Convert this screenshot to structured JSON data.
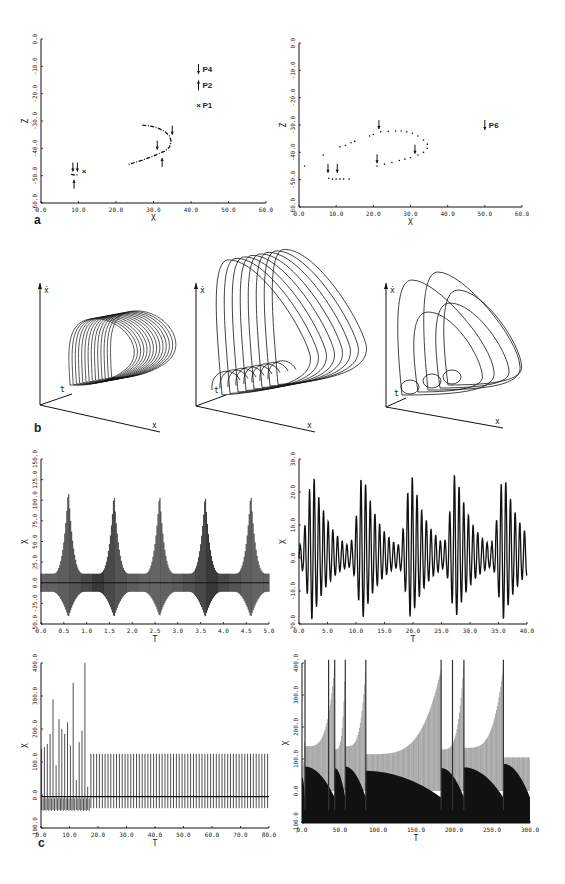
{
  "figure": {
    "panel_labels": {
      "a": "a",
      "b": "b",
      "c": "c"
    }
  },
  "chart_data": [
    {
      "id": "a-left",
      "type": "scatter",
      "title": "",
      "xlabel": "X",
      "ylabel": "Z",
      "xlim": [
        0,
        60
      ],
      "ylim": [
        -60,
        0
      ],
      "xticks": [
        "0.0",
        "10.0",
        "20.0",
        "30.0",
        "40.0",
        "50.0",
        "60.0"
      ],
      "yticks": [
        "0.0",
        "-10.0",
        "-20.0",
        "-30.0",
        "-40.0",
        "-50.0",
        "-60.0"
      ],
      "annotations": [
        {
          "text": "P4",
          "marker": "arrow-down",
          "x": 42,
          "y": -11
        },
        {
          "text": "P2",
          "marker": "arrow-up",
          "x": 42,
          "y": -17
        },
        {
          "text": "P1",
          "marker": "x",
          "x": 42,
          "y": -24
        }
      ],
      "series": [
        {
          "name": "P1",
          "marker": "x",
          "points": [
            [
              11.5,
              -48.5
            ]
          ]
        },
        {
          "name": "curve",
          "marker": "dash",
          "points": [
            [
              27,
              -31.5
            ],
            [
              29,
              -31.8
            ],
            [
              31,
              -32.5
            ],
            [
              33,
              -33.8
            ],
            [
              34.3,
              -35.5
            ],
            [
              34.7,
              -37.5
            ],
            [
              34.3,
              -39.5
            ],
            [
              33,
              -41
            ],
            [
              31,
              -42.2
            ],
            [
              29,
              -43.3
            ],
            [
              27,
              -44.3
            ],
            [
              25,
              -45.2
            ],
            [
              23,
              -46
            ]
          ]
        },
        {
          "name": "cluster",
          "marker": "dash",
          "points": [
            [
              8,
              -49.5
            ],
            [
              9,
              -49.8
            ],
            [
              10,
              -49.6
            ]
          ]
        }
      ],
      "arrows": [
        {
          "dir": "down",
          "x": 35,
          "y": -35
        },
        {
          "dir": "down",
          "x": 31,
          "y": -40.5
        },
        {
          "dir": "up",
          "x": 32.3,
          "y": -43.5
        },
        {
          "dir": "down",
          "x": 8.5,
          "y": -48.5
        },
        {
          "dir": "down",
          "x": 9.7,
          "y": -48.5
        },
        {
          "dir": "up",
          "x": 8.8,
          "y": -51.5
        }
      ]
    },
    {
      "id": "a-right",
      "type": "scatter",
      "xlabel": "X",
      "ylabel": "Z",
      "xlim": [
        0,
        60
      ],
      "ylim": [
        -60,
        0
      ],
      "xticks": [
        "0.0",
        "10.0",
        "20.0",
        "30.0",
        "40.0",
        "50.0",
        "60.0"
      ],
      "yticks": [
        "0.0",
        "-10.0",
        "-20.0",
        "-30.0",
        "-40.0",
        "-50.0",
        "-60.0"
      ],
      "annotations": [
        {
          "text": "P6",
          "marker": "arrow-down",
          "x": 50,
          "y": -30
        }
      ],
      "series": [
        {
          "name": "orbit",
          "marker": "dot",
          "points": [
            [
              1.5,
              -45
            ],
            [
              6.5,
              -41
            ],
            [
              11,
              -38
            ],
            [
              12.5,
              -37.5
            ],
            [
              14,
              -36.5
            ],
            [
              15,
              -36
            ],
            [
              19,
              -34
            ],
            [
              20,
              -33.5
            ],
            [
              22,
              -32.5
            ],
            [
              24,
              -32.3
            ],
            [
              26,
              -32.2
            ],
            [
              27.5,
              -32.2
            ],
            [
              29,
              -32.5
            ],
            [
              30.5,
              -33
            ],
            [
              32,
              -34
            ],
            [
              33.5,
              -35.5
            ],
            [
              34.5,
              -37
            ],
            [
              34.5,
              -38.5
            ],
            [
              33.5,
              -40
            ],
            [
              32,
              -41
            ],
            [
              30,
              -42
            ],
            [
              28.5,
              -42.5
            ],
            [
              27,
              -43
            ],
            [
              25,
              -43.7
            ],
            [
              23,
              -44.3
            ],
            [
              21,
              -45
            ],
            [
              8,
              -49.5
            ],
            [
              9,
              -49.8
            ],
            [
              10,
              -49.8
            ],
            [
              11,
              -49.8
            ],
            [
              12,
              -49.8
            ],
            [
              13.5,
              -49.8
            ]
          ]
        }
      ],
      "arrows": [
        {
          "dir": "down",
          "x": 21.5,
          "y": -31.5
        },
        {
          "dir": "down",
          "x": 31.2,
          "y": -40.5
        },
        {
          "dir": "down",
          "x": 21,
          "y": -44
        },
        {
          "dir": "down",
          "x": 7.8,
          "y": -47.5
        },
        {
          "dir": "down",
          "x": 10.3,
          "y": -47.5
        }
      ]
    },
    {
      "id": "b-left",
      "type": "line",
      "title": "3D phase portrait",
      "axis_labels": {
        "vertical": "ẋ",
        "depth": "t",
        "horizontal": "x"
      },
      "loops": 14
    },
    {
      "id": "b-middle",
      "type": "line",
      "axis_labels": {
        "vertical": "ẋ",
        "depth": "t",
        "horizontal": "x"
      },
      "loops": 8
    },
    {
      "id": "b-right",
      "type": "line",
      "axis_labels": {
        "vertical": "ẋ",
        "depth": "t",
        "horizontal": "x"
      },
      "loops": 5
    },
    {
      "id": "c-top-left",
      "type": "line",
      "xlabel": "T",
      "ylabel": "X",
      "xlim": [
        0,
        5
      ],
      "ylim": [
        -50,
        150
      ],
      "xticks": [
        "0.0",
        "0.5",
        "1.0",
        "1.5",
        "2.0",
        "2.5",
        "3.0",
        "3.5",
        "4.0",
        "4.5",
        "5.0"
      ],
      "yticks": [
        "150.0",
        "125.0",
        "100.0",
        "75.0",
        "50.0",
        "25.0",
        "0.0",
        "-25.0",
        "-50.0"
      ],
      "peaks": [
        {
          "t": 0.6,
          "max": 115,
          "min": -42
        },
        {
          "t": 1.6,
          "max": 110,
          "min": -42
        },
        {
          "t": 2.6,
          "max": 110,
          "min": -41
        },
        {
          "t": 3.6,
          "max": 109,
          "min": -42
        },
        {
          "t": 4.6,
          "max": 110,
          "min": -42
        }
      ],
      "baseline": {
        "max": 11,
        "min": -11
      },
      "period": 1.0
    },
    {
      "id": "c-top-right",
      "type": "line",
      "xlabel": "T",
      "ylabel": "X",
      "xlim": [
        0,
        40
      ],
      "ylim": [
        -20,
        30
      ],
      "xticks": [
        "0.0",
        "5.0",
        "10.0",
        "15.0",
        "20.0",
        "25.0",
        "30.0",
        "35.0",
        "40.0"
      ],
      "yticks": [
        "30.0",
        "20.0",
        "10.0",
        "0.0",
        "-10.0",
        "-20.0"
      ],
      "bursts": [
        1.5,
        10.3,
        18.8,
        26.6,
        35.0
      ],
      "max_amp": 27,
      "min_amp": -19
    },
    {
      "id": "c-bottom-left",
      "type": "line",
      "xlabel": "T",
      "ylabel": "X",
      "xlim": [
        0,
        80
      ],
      "ylim": [
        -100,
        400
      ],
      "xticks": [
        "0.0",
        "10.0",
        "20.0",
        "30.0",
        "40.0",
        "50.0",
        "60.0",
        "70.0",
        "80.0"
      ],
      "yticks": [
        "400.0",
        "300.0",
        "200.0",
        "100.0",
        "0.0",
        "-100.0"
      ],
      "transient_peaks": [
        [
          0.2,
          140
        ],
        [
          1.2,
          145
        ],
        [
          2.2,
          155
        ],
        [
          3.2,
          185
        ],
        [
          4.2,
          290
        ],
        [
          5.3,
          90
        ],
        [
          6.3,
          230
        ],
        [
          7.3,
          200
        ],
        [
          8.3,
          185
        ],
        [
          9.3,
          220
        ],
        [
          10.3,
          150
        ],
        [
          11.3,
          340
        ],
        [
          12.4,
          45
        ],
        [
          13.4,
          160
        ],
        [
          14.4,
          195
        ],
        [
          15.4,
          400
        ],
        [
          16.4,
          25
        ]
      ],
      "steady_state": {
        "start": 17.5,
        "max": 125,
        "min": -40,
        "period": 1.0
      }
    },
    {
      "id": "c-bottom-right",
      "type": "line",
      "xlabel": "T",
      "ylabel": "X",
      "xlim": [
        0,
        300
      ],
      "ylim": [
        -100,
        400
      ],
      "xticks": [
        "0.0",
        "50.0",
        "100.0",
        "150.0",
        "200.0",
        "250.0",
        "300.0"
      ],
      "yticks": [
        "400.0",
        "300.0",
        "200.0",
        "100.0",
        "0.0",
        "-100.0"
      ],
      "segments": [
        {
          "start": 0,
          "end": 4,
          "lo": 80,
          "hi": 240
        },
        {
          "start": 4,
          "end": 43,
          "lo": 140,
          "hi": 390
        },
        {
          "start": 43,
          "end": 57,
          "lo": 130,
          "hi": 400
        },
        {
          "start": 57,
          "end": 84,
          "lo": 140,
          "hi": 390
        },
        {
          "start": 84,
          "end": 183,
          "lo": 115,
          "hi": 380
        },
        {
          "start": 183,
          "end": 213,
          "lo": 130,
          "hi": 400
        },
        {
          "start": 213,
          "end": 265,
          "lo": 135,
          "hi": 390
        },
        {
          "start": 265,
          "end": 300,
          "lo": 105,
          "hi": 105
        }
      ],
      "spikes": [
        4,
        35,
        43,
        57,
        84,
        183,
        198,
        213,
        265
      ]
    }
  ]
}
